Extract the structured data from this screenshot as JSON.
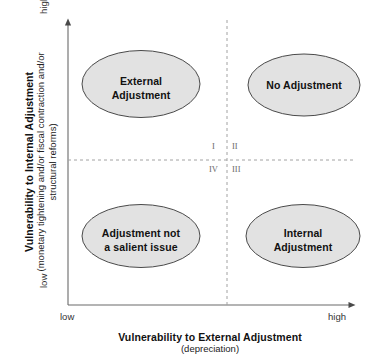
{
  "figure": {
    "axes": {
      "y": {
        "title": "Vulnerability to Internal Adjustment",
        "subtitle": "(monetary tightening and/or fiscal contraction and/or structural reforms)",
        "low_label": "low",
        "high_label": "high"
      },
      "x": {
        "title": "Vulnerability to External Adjustment",
        "subtitle": "(depreciation)",
        "low_label": "low",
        "high_label": "high"
      }
    },
    "quadrant_numbers": {
      "top_left": "I",
      "top_right": "II",
      "bottom_right": "III",
      "bottom_left": "IV"
    },
    "quadrants": [
      {
        "id": "q1",
        "label_line1": "External",
        "label_line2": "Adjustment"
      },
      {
        "id": "q2",
        "label_line1": "No Adjustment",
        "label_line2": ""
      },
      {
        "id": "q4",
        "label_line1": "Adjustment not",
        "label_line2": "a salient issue"
      },
      {
        "id": "q3",
        "label_line1": "Internal",
        "label_line2": "Adjustment"
      }
    ],
    "colors": {
      "ellipse_fill": "#e2e2e2",
      "ellipse_stroke": "#4a4a4a",
      "axis": "#5a5a5a",
      "divider": "#9a9a9a",
      "text": "#111111"
    }
  }
}
